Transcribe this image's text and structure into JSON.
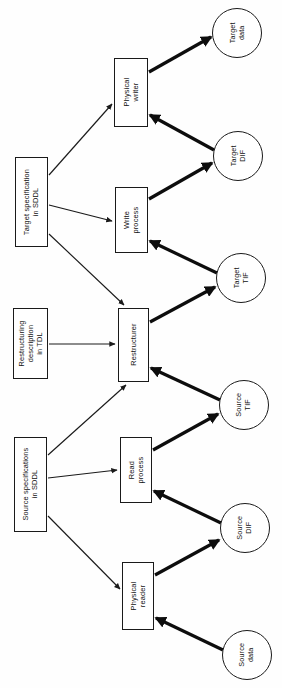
{
  "diagram": {
    "orientation": "rotated-90-ccw",
    "type": "flow-diagram",
    "colors": {
      "background": "#ffffff",
      "stroke": "#1a1a1a",
      "thick_stroke": "#0d0d0d",
      "text": "#111111"
    },
    "nodes": [
      {
        "id": "target-data",
        "shape": "circle",
        "label": "Target\ndata",
        "x": 212,
        "y": 8,
        "w": 50,
        "h": 50
      },
      {
        "id": "target-dif",
        "shape": "circle",
        "label": "Target\nDIF",
        "x": 213,
        "y": 131,
        "w": 50,
        "h": 50
      },
      {
        "id": "target-tif",
        "shape": "circle",
        "label": "Target\nTIF",
        "x": 216,
        "y": 253,
        "w": 50,
        "h": 50
      },
      {
        "id": "source-tif",
        "shape": "circle",
        "label": "Source\nTIF",
        "x": 219,
        "y": 380,
        "w": 50,
        "h": 50
      },
      {
        "id": "source-dif",
        "shape": "circle",
        "label": "Source\nDIF",
        "x": 220,
        "y": 503,
        "w": 50,
        "h": 50
      },
      {
        "id": "source-data",
        "shape": "circle",
        "label": "Source\ndata",
        "x": 222,
        "y": 630,
        "w": 50,
        "h": 50
      },
      {
        "id": "physical-writer",
        "shape": "box",
        "label": "Physical\nwriter",
        "x": 114,
        "y": 58,
        "w": 34,
        "h": 69
      },
      {
        "id": "write-process",
        "shape": "box",
        "label": "Write\nprocess",
        "x": 115,
        "y": 187,
        "w": 33,
        "h": 66
      },
      {
        "id": "restructurer",
        "shape": "box",
        "label": "Restructurer",
        "x": 118,
        "y": 308,
        "w": 31,
        "h": 74
      },
      {
        "id": "read-process",
        "shape": "box",
        "label": "Read\nprocess",
        "x": 120,
        "y": 437,
        "w": 32,
        "h": 66
      },
      {
        "id": "physical-reader",
        "shape": "box",
        "label": "Physical\nreader",
        "x": 122,
        "y": 562,
        "w": 32,
        "h": 68
      },
      {
        "id": "target-specification-sddl",
        "shape": "box",
        "label": "Target specification\nin SDDL",
        "x": 15,
        "y": 157,
        "w": 33,
        "h": 90
      },
      {
        "id": "restructuring-description-tdl",
        "shape": "box",
        "label": "Restructuring\ndescription\nin TDL",
        "x": 13,
        "y": 308,
        "w": 35,
        "h": 71
      },
      {
        "id": "source-specifications-sddl",
        "shape": "box",
        "label": "Source specifications\nin SDDL",
        "x": 14,
        "y": 437,
        "w": 33,
        "h": 95
      }
    ],
    "edges": [
      {
        "id": "e-targetspec-physwriter",
        "from": "target-specification-sddl",
        "to": "physical-writer",
        "weight": "thin"
      },
      {
        "id": "e-targetspec-writeproc",
        "from": "target-specification-sddl",
        "to": "write-process",
        "weight": "thin"
      },
      {
        "id": "e-targetspec-restructurer",
        "from": "target-specification-sddl",
        "to": "restructurer",
        "weight": "thin"
      },
      {
        "id": "e-restrdesc-restructurer",
        "from": "restructuring-description-tdl",
        "to": "restructurer",
        "weight": "thin"
      },
      {
        "id": "e-sourcespec-restructurer",
        "from": "source-specifications-sddl",
        "to": "restructurer",
        "weight": "thin"
      },
      {
        "id": "e-sourcespec-readproc",
        "from": "source-specifications-sddl",
        "to": "read-process",
        "weight": "thin"
      },
      {
        "id": "e-sourcespec-physreader",
        "from": "source-specifications-sddl",
        "to": "physical-reader",
        "weight": "thin"
      },
      {
        "id": "e-physwriter-targetdata",
        "from": "physical-writer",
        "to": "target-data",
        "weight": "thick"
      },
      {
        "id": "e-targetdif-physwriter",
        "from": "target-dif",
        "to": "physical-writer",
        "weight": "thick"
      },
      {
        "id": "e-writeproc-targetdif",
        "from": "write-process",
        "to": "target-dif",
        "weight": "thick"
      },
      {
        "id": "e-targettif-writeproc",
        "from": "target-tif",
        "to": "write-process",
        "weight": "thick"
      },
      {
        "id": "e-restructurer-targettif",
        "from": "restructurer",
        "to": "target-tif",
        "weight": "thick"
      },
      {
        "id": "e-sourcetif-restructurer",
        "from": "source-tif",
        "to": "restructurer",
        "weight": "thick"
      },
      {
        "id": "e-readproc-sourcetif",
        "from": "read-process",
        "to": "source-tif",
        "weight": "thick"
      },
      {
        "id": "e-sourcedif-readproc",
        "from": "source-dif",
        "to": "read-process",
        "weight": "thick"
      },
      {
        "id": "e-physreader-sourcedif",
        "from": "physical-reader",
        "to": "source-dif",
        "weight": "thick"
      },
      {
        "id": "e-sourcedata-physreader",
        "from": "source-data",
        "to": "physical-reader",
        "weight": "thick"
      }
    ]
  }
}
